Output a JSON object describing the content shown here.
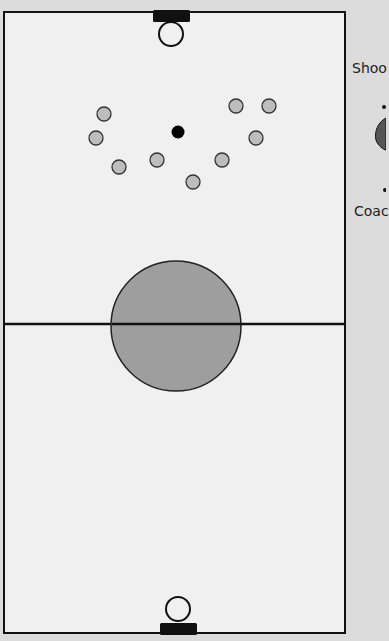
{
  "field": {
    "background": "#f0f0f0",
    "line_color": "#111111",
    "outside_background": "#dcdcdc",
    "midline_y": 324,
    "center_circle": {
      "cx": 176,
      "cy": 326,
      "r": 65,
      "fill": "#9e9e9e"
    }
  },
  "goals": [
    {
      "name": "top-goal",
      "box": {
        "x": 153,
        "y": 10,
        "w": 37,
        "h": 12
      },
      "crease": {
        "cx": 171,
        "cy": 34,
        "r": 12
      }
    },
    {
      "name": "bottom-goal",
      "box": {
        "x": 160,
        "y": 623,
        "w": 37,
        "h": 12
      },
      "crease": {
        "cx": 178,
        "cy": 609,
        "r": 12
      }
    }
  ],
  "players": [
    {
      "cx": 104,
      "cy": 114
    },
    {
      "cx": 96,
      "cy": 138
    },
    {
      "cx": 119,
      "cy": 167
    },
    {
      "cx": 157,
      "cy": 160
    },
    {
      "cx": 193,
      "cy": 182
    },
    {
      "cx": 222,
      "cy": 160
    },
    {
      "cx": 256,
      "cy": 138
    },
    {
      "cx": 236,
      "cy": 106
    },
    {
      "cx": 269,
      "cy": 106
    }
  ],
  "player_style": {
    "r": 7,
    "fill": "#bdbdbd",
    "stroke": "#333333"
  },
  "ball": {
    "cx": 178,
    "cy": 132,
    "r": 6.5,
    "fill": "#000000"
  },
  "legend": {
    "shooter_label": "Shoo",
    "coach_label": "Coac"
  }
}
